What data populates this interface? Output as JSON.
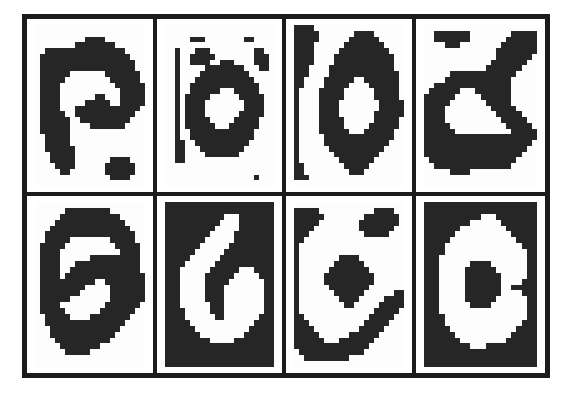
{
  "figure": {
    "title": "",
    "caption": "",
    "rows": 2,
    "columns": 4,
    "frame_color": "#1c1c1c",
    "background_color": "#ffffff",
    "ink_color": "#262626",
    "paper_color": "#fdfdfd"
  },
  "chart_data": {
    "type": "heatmap",
    "title": "",
    "xlabel": "",
    "ylabel": "",
    "grid": true,
    "legend": "none",
    "note": "Each panel is a binary (0/1) bitmap of a handwritten character, 22 columns by 28 rows. 1 = dark ink pixel, 0 = light paper pixel.",
    "bitmap_width": 22,
    "bitmap_height": 28,
    "panels": [
      {
        "index": 1,
        "row": 1,
        "col": 1,
        "label": "a",
        "polarity": "dark-on-light",
        "bitmap": [
          "0000000000000000000000",
          "0000000000000000000000",
          "0000000000111100000000",
          "0000000011111111000000",
          "0011111111111111110000",
          "0111111111111111111000",
          "0111111111111111111100",
          "0111111111111111111100",
          "0111111000000011111110",
          "0111110000000001111110",
          "0111100000000000111111",
          "0111100000000000011111",
          "0111100000001100011111",
          "0111100000111110011111",
          "0111100011111111111110",
          "0111110011111111111100",
          "0111111001111111111000",
          "0111111000011111110000",
          "0111111000000000000000",
          "0011111000000000000000",
          "0011111000000000000000",
          "0011111100000000000000",
          "0001111100000000000000",
          "0001111100000001111000",
          "0000111100000011111100",
          "0000011000000011111100",
          "0000000000000001111000",
          "0000000000000000000000"
        ]
      },
      {
        "index": 2,
        "row": 1,
        "col": 2,
        "label": "o",
        "polarity": "dark-on-light",
        "bitmap": [
          "0000000000000000000000",
          "0000000000000000000000",
          "0000011100000000110000",
          "0000000000000000000000",
          "0010001110000000001100",
          "0010011111000000001110",
          "0010011110011100001110",
          "0010000011111111000110",
          "0010000111111111100000",
          "0010001111111111110000",
          "0010011111111111111000",
          "0010011111100011111000",
          "0010111110000001111100",
          "0010111100000000111100",
          "0010111100000000111100",
          "0010111100000001111100",
          "0010111110000011111000",
          "0010111111000111111000",
          "0010011111111111110000",
          "0010011111111111110000",
          "0011001111111111100000",
          "0011000111111111000000",
          "0011000011111110000000",
          "0011000000000000000000",
          "0000000000000000000000",
          "0000000000000000000000",
          "0000000000000000001000",
          "0000000000000000000000"
        ]
      },
      {
        "index": 3,
        "row": 1,
        "col": 3,
        "label": "o",
        "polarity": "dark-on-light",
        "bitmap": [
          "1111000000000000000000",
          "1111100000001111000000",
          "1111100000011111100000",
          "1111000000111111110000",
          "1111000001111111111000",
          "1111000011111111111100",
          "1111000011111111111100",
          "1110000111111111111100",
          "1110000111111111111110",
          "1100001111110011111110",
          "1100001111100001111110",
          "1000011111000000111110",
          "1000011111000000111110",
          "1000011110000000011111",
          "1000011110000000011111",
          "1000011110000000111111",
          "1000011111000000111110",
          "1000011111000001111110",
          "1000011111100011111100",
          "1000001111111111111100",
          "1000001111111111111000",
          "1000000111111111110000",
          "1000000011111111100000",
          "1000000001111111000000",
          "1100000000111110000000",
          "1100000000011100000000",
          "1110000000000000000000",
          "0000000000000000000000"
        ]
      },
      {
        "index": 4,
        "row": 1,
        "col": 4,
        "label": "a",
        "polarity": "dark-on-light",
        "bitmap": [
          "0000000000000000000000",
          "0011111110000000011111",
          "0011111110000000111111",
          "0000111000000001111111",
          "0000000000000011111111",
          "0000000000000011111110",
          "0000000000000111111100",
          "0000000000001111111000",
          "0000011111111111110000",
          "0000111111111111100000",
          "0011111111111111100000",
          "0111111000111111100000",
          "1111110000011111100000",
          "1111100000001111100000",
          "1111000000000111110000",
          "1111000000000011111000",
          "1111000000000001111100",
          "1111100000000000111110",
          "1111110000000000011111",
          "1111111111111111111111",
          "1111111111111111111110",
          "1111111111111111111100",
          "1111111111111111111000",
          "0111111111111111110000",
          "0011111111111111100000",
          "0000011110000000000000",
          "0000000000000000000000",
          "0000000000000000000000"
        ]
      },
      {
        "index": 5,
        "row": 2,
        "col": 1,
        "label": "a",
        "polarity": "dark-on-light",
        "bitmap": [
          "0000000000000000000000",
          "0000001111111110000000",
          "0000011111111111100000",
          "0000111111111111110000",
          "0001111111111111111000",
          "0011111111111111111100",
          "0011111000000001111100",
          "0111110000000000111110",
          "0111100000000000011110",
          "0111100000011111111110",
          "0111100011111111111110",
          "0111100111111111111110",
          "0111101111111111111111",
          "0111111111110011111111",
          "0111111111000001111111",
          "0111111110000001111111",
          "0111111000000001111111",
          "0111100000000011111110",
          "0111110000000111111100",
          "0011111000011111111000",
          "0011111111111111110000",
          "0001111111111111100000",
          "0001111111111111000000",
          "0000111111111110000000",
          "0000011111111000000000",
          "0000001111100000000000",
          "0000000000000000000000",
          "0000000000000000000000"
        ]
      },
      {
        "index": 6,
        "row": 2,
        "col": 2,
        "label": "6",
        "polarity": "light-on-dark",
        "bitmap": [
          "1111111111111111111111",
          "1111111111111111111111",
          "1111111111110001111111",
          "1111111111100001111111",
          "1111111111000001111111",
          "1111111110000011111111",
          "1111111100000011111111",
          "1111111000000111111111",
          "1111110000001111111111",
          "1111100000011111111111",
          "1111000000111111111111",
          "1110000001111110001111",
          "1110000011111100000111",
          "1110000011111000000011",
          "1110000011110000000011",
          "1110000011110000000011",
          "1110000011110000000011",
          "1110000001110000000011",
          "1111000001110000000011",
          "1111000000110000000111",
          "1111100000000000001111",
          "1111110000000000011111",
          "1111111000000000111111",
          "1111111110000011111111",
          "1111111111111111111111",
          "1111111111111111111111",
          "1111111111111111111111",
          "1111111111111111111111"
        ]
      },
      {
        "index": 7,
        "row": 2,
        "col": 3,
        "label": "e",
        "polarity": "dark-on-light",
        "bitmap": [
          "0000000000000000000000",
          "1111100000000000111100",
          "1111110000000011111110",
          "1111100000000111111110",
          "1111000000000111111100",
          "1110000000000011111000",
          "1100000000000000000000",
          "1000000000000000000000",
          "1000000000000000000000",
          "1000000001111000000000",
          "1000000011111100000000",
          "1000000111111110000000",
          "1000001111111111000000",
          "1000001111111111000000",
          "1000000111111110000000",
          "1000000011111100000011",
          "1000000001111000001111",
          "1000000000110000011111",
          "1000000000000000111110",
          "1100000000000001111100",
          "1110000000000011111000",
          "1111000000000111110000",
          "1111100000011111100000",
          "1111110001111111000000",
          "1111111111111110000000",
          "0111111111111100000000",
          "0011111111100000000000",
          "0000000000000000000000"
        ]
      },
      {
        "index": 8,
        "row": 2,
        "col": 4,
        "label": "0",
        "polarity": "light-on-dark",
        "bitmap": [
          "1111111111111111111111",
          "1111111111111111111111",
          "1111111111100011111111",
          "1111111110000001111111",
          "1111111000000000111111",
          "1111110000000000011111",
          "1111100000000000001111",
          "1111000000000000000111",
          "1111000000000000000011",
          "1110000000000000000011",
          "1110000001111000000011",
          "1110000011111100000011",
          "1110000011111110000011",
          "1110000011111110000111",
          "1110000011111110011111",
          "1110000011111110000111",
          "1110000011111100000011",
          "1110000001111000000011",
          "1110000000000000000011",
          "1111000000000000000011",
          "1111000000000000000111",
          "1111100000000000001111",
          "1111110000000000011111",
          "1111111000000000111111",
          "1111111110001111111111",
          "1111111111111111111111",
          "1111111111111111111111",
          "1111111111111111111111"
        ]
      }
    ]
  }
}
